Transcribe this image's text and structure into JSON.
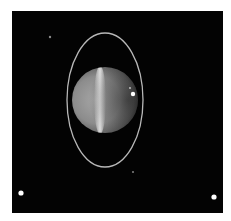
{
  "image": {
    "subject": "Uranus with rings and moons",
    "background_color": "#030303",
    "planet": {
      "cx": 105,
      "cy": 100,
      "r": 33,
      "band_color": "#e8e8e8",
      "body_color": "#9a9a9a"
    },
    "ring": {
      "cx": 105,
      "cy": 100,
      "rx": 38,
      "ry": 67,
      "color": "#b8b8b8"
    },
    "moons": [
      {
        "name": "moon-top-left",
        "cx": 50,
        "cy": 37,
        "r": 1.2,
        "color": "#8a8a8a"
      },
      {
        "name": "moon-bottom-left",
        "cx": 21,
        "cy": 193,
        "r": 2.6,
        "color": "#ffffff"
      },
      {
        "name": "moon-bottom-right",
        "cx": 214,
        "cy": 197,
        "r": 2.6,
        "color": "#ffffff"
      },
      {
        "name": "moon-below-ring",
        "cx": 133,
        "cy": 172,
        "r": 1.1,
        "color": "#7a7a7a"
      }
    ],
    "storm_spot": {
      "cx": 133,
      "cy": 94,
      "r": 2.2
    }
  }
}
